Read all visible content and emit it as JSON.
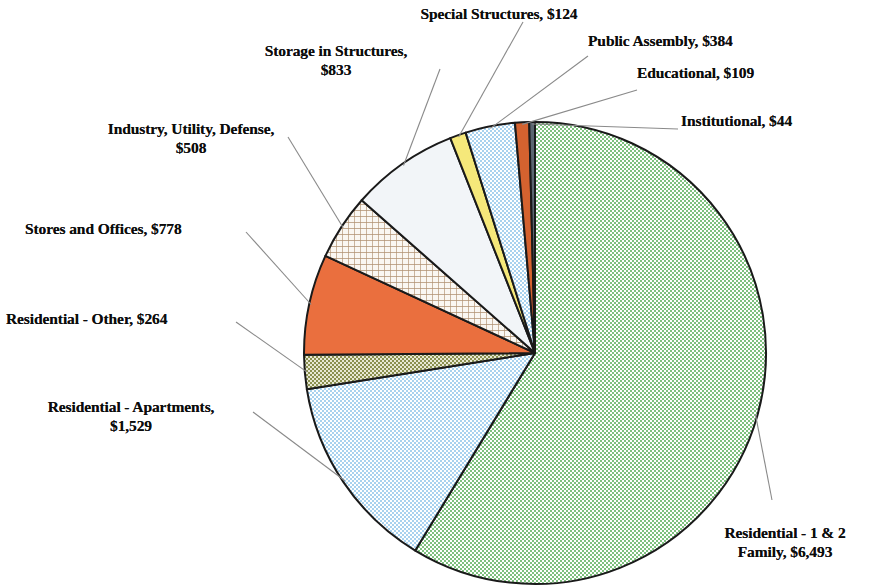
{
  "chart_data": {
    "type": "pie",
    "title": "",
    "subtitle": "",
    "xlabel": "",
    "ylabel": "",
    "legend_position": "callout-labels",
    "grid": false,
    "value_prefix": "$",
    "total": 11066,
    "start_angle_deg": 0,
    "direction": "clockwise",
    "categories": [
      "Residential - 1 & 2 Family",
      "Residential - Apartments",
      "Residential - Other",
      "Stores and Offices",
      "Industry, Utility, Defense",
      "Storage in Structures",
      "Special Structures",
      "Public Assembly",
      "Educational",
      "Institutional"
    ],
    "values": [
      6493,
      1529,
      264,
      778,
      508,
      833,
      124,
      384,
      109,
      44
    ],
    "slices": [
      {
        "name": "Residential - 1 & 2 Family",
        "value": 6493,
        "label": "Residential - 1 & 2\nFamily, $6,493",
        "fill": "#a9d6a9",
        "pattern": "dots-green"
      },
      {
        "name": "Residential - Apartments",
        "value": 1529,
        "label": "Residential - Apartments,\n$1,529",
        "fill": "#c9e2f3",
        "pattern": "dots-blue"
      },
      {
        "name": "Residential - Other",
        "value": 264,
        "label": "Residential - Other, $264",
        "fill": "#9aa063",
        "pattern": "checks-olive"
      },
      {
        "name": "Stores and Offices",
        "value": 778,
        "label": "Stores and Offices, $778",
        "fill": "#ea6f3e",
        "pattern": "solid-orange"
      },
      {
        "name": "Industry, Utility, Defense",
        "value": 508,
        "label": "Industry, Utility, Defense,\n$508",
        "fill": "#f4efe7",
        "pattern": "grid-tan"
      },
      {
        "name": "Storage in Structures",
        "value": 833,
        "label": "Storage in Structures,\n$833",
        "fill": "#f2f5f8",
        "pattern": "solid-white"
      },
      {
        "name": "Special Structures",
        "value": 124,
        "label": "Special Structures, $124",
        "fill": "#f5e87a",
        "pattern": "solid-yellow"
      },
      {
        "name": "Public Assembly",
        "value": 384,
        "label": "Public Assembly, $384",
        "fill": "#c9e2f3",
        "pattern": "dots-blue"
      },
      {
        "name": "Educational",
        "value": 109,
        "label": "Educational, $109",
        "fill": "#d4622f",
        "pattern": "solid-orange-dark"
      },
      {
        "name": "Institutional",
        "value": 44,
        "label": "Institutional, $44",
        "fill": "#5b6670",
        "pattern": "solid-slate"
      }
    ],
    "colors": {
      "green": "#a9d6a9",
      "light_blue": "#c9e2f3",
      "olive": "#9aa063",
      "orange": "#ea6f3e",
      "tan": "#b09070",
      "white": "#f2f5f8",
      "yellow": "#f5e87a",
      "orange_dark": "#d4622f",
      "slate": "#5b6670",
      "outline": "#1a1a1a",
      "leader": "#8a8a8a",
      "text": "#0c0c0c"
    }
  },
  "labels": {
    "special_structures": "Special Structures, $124",
    "public_assembly": "Public Assembly, $384",
    "educational": "Educational, $109",
    "institutional": "Institutional, $44",
    "storage_in_structures": "Storage in Structures,\n$833",
    "industry_utility_defense": "Industry, Utility, Defense,\n$508",
    "stores_and_offices": "Stores and Offices, $778",
    "residential_other": "Residential - Other, $264",
    "residential_apartments": "Residential - Apartments,\n$1,529",
    "residential_1_2_family": "Residential - 1 & 2\nFamily, $6,493"
  }
}
